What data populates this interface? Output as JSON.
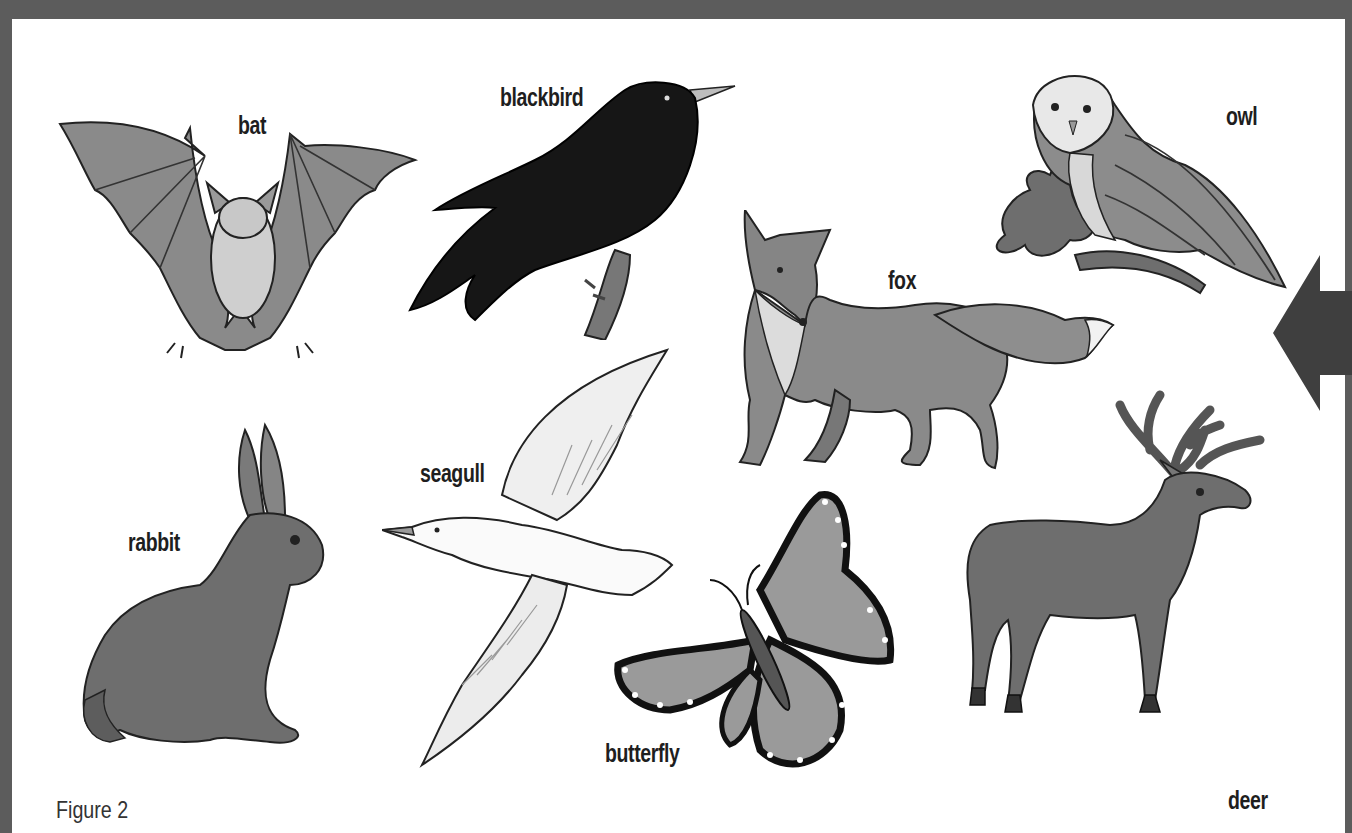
{
  "figure": {
    "caption": "Figure 2",
    "frame_color": "#5c5c5c",
    "background_color": "#ffffff",
    "navigation_arrow": {
      "direction": "left",
      "color": "#3f3f3f"
    }
  },
  "animals": [
    {
      "id": "bat",
      "label": "bat"
    },
    {
      "id": "blackbird",
      "label": "blackbird"
    },
    {
      "id": "owl",
      "label": "owl"
    },
    {
      "id": "fox",
      "label": "fox"
    },
    {
      "id": "rabbit",
      "label": "rabbit"
    },
    {
      "id": "seagull",
      "label": "seagull"
    },
    {
      "id": "butterfly",
      "label": "butterfly"
    },
    {
      "id": "deer",
      "label": "deer"
    }
  ]
}
